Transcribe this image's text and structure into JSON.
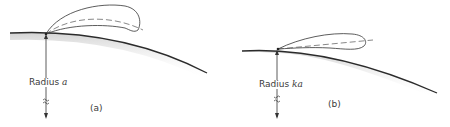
{
  "figure": {
    "panels": [
      {
        "id": "a",
        "caption": "(a)",
        "radius_label_prefix": "Radius",
        "radius_symbol": "a",
        "description": "Radiation lobe elevated above curved earth of radius a"
      },
      {
        "id": "b",
        "caption": "(b)",
        "radius_label_prefix": "Radius",
        "radius_symbol": "ka",
        "description": "Radiation lobe closer to horizon over curved earth of effective radius ka"
      }
    ],
    "colors": {
      "line": "#2b2b2b",
      "shading": "#d9d9d9",
      "text": "#3a3a3a"
    }
  }
}
